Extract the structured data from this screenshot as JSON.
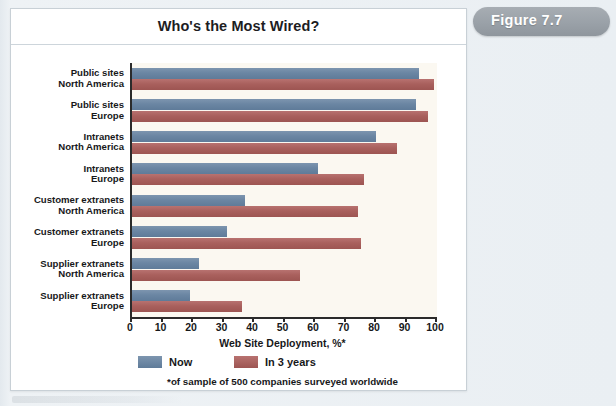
{
  "figure_tab": {
    "label": "Figure 7.7"
  },
  "chart_data": {
    "type": "bar",
    "orientation": "horizontal",
    "title": "Who's the Most Wired?",
    "xlabel": "Web Site Deployment, %*",
    "ylabel": "",
    "xlim": [
      0,
      100
    ],
    "grid": false,
    "legend_position": "bottom-left",
    "footnote": "*of sample of 500 companies surveyed worldwide",
    "tick_labels": [
      "0",
      "10",
      "20",
      "30",
      "40",
      "50",
      "60",
      "70",
      "80",
      "90",
      "100"
    ],
    "tick_values": [
      0,
      10,
      20,
      30,
      40,
      50,
      60,
      70,
      80,
      90,
      100
    ],
    "categories": [
      {
        "line1": "Public sites",
        "line2": "North America"
      },
      {
        "line1": "Public sites",
        "line2": "Europe"
      },
      {
        "line1": "Intranets",
        "line2": "North America"
      },
      {
        "line1": "Intranets",
        "line2": "Europe"
      },
      {
        "line1": "Customer extranets",
        "line2": "North America"
      },
      {
        "line1": "Customer extranets",
        "line2": "Europe"
      },
      {
        "line1": "Supplier extranets",
        "line2": "North America"
      },
      {
        "line1": "Supplier extranets",
        "line2": "Europe"
      }
    ],
    "series": [
      {
        "name": "Now",
        "color": "#6d87a4",
        "values": [
          94,
          93,
          80,
          61,
          37,
          31,
          22,
          19
        ]
      },
      {
        "name": "In 3 years",
        "color": "#ab5f5c",
        "values": [
          99,
          97,
          87,
          76,
          74,
          75,
          55,
          36
        ]
      }
    ]
  },
  "colors": {
    "series_now": "#6d87a4",
    "series_future": "#ab5f5c",
    "plot_background": "#fbf8f1",
    "card_background": "#ffffff",
    "page_background": "#e9eef2",
    "tab_background": "#9aa1a8",
    "axis": "#2b2b2b"
  }
}
